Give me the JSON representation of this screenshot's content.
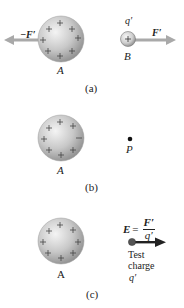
{
  "figure": {
    "panels": [
      {
        "id": "a",
        "caption": "(a)",
        "sphere_label": "A",
        "force_on_A_label": "−F′",
        "test_charge_label": "q′",
        "test_charge_sign": "+",
        "test_sphere_label": "B",
        "force_on_B_label": "F′"
      },
      {
        "id": "b",
        "caption": "(b)",
        "sphere_label": "A",
        "point_label": "P"
      },
      {
        "id": "c",
        "caption": "(c)",
        "sphere_label": "A",
        "equation": {
          "lhs": "E",
          "equals": "=",
          "numerator": "F′",
          "denominator": "q′"
        },
        "test_charge_text_line1": "Test",
        "test_charge_text_line2": "charge",
        "test_charge_symbol": "q′"
      }
    ],
    "charge_sign": "+",
    "colors": {
      "sphere_light": "#f2f2f2",
      "sphere_mid": "#c4c4c4",
      "sphere_dark": "#8a8a8a",
      "arrow_gray": "#a9a9a9",
      "arrow_dark": "#222222",
      "text": "#222222"
    }
  }
}
